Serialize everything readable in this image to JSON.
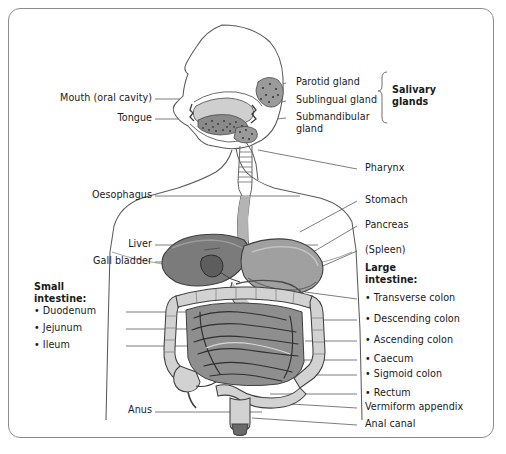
{
  "figure": {
    "border_color": "#8c8c8c",
    "background": "#ffffff",
    "text_color": "#1a1a1a",
    "leader_line_color": "#6e6e6e"
  },
  "palette": {
    "outline": "#4a4a4a",
    "liver": "#7b7b7b",
    "stomach": "#a0a0a0",
    "gall_bladder": "#5d5d5d",
    "small_intestine": "#8e8e8e",
    "large_intestine": "#d2d2d2",
    "mouth_cavity": "#cfcfcf",
    "tongue": "#8a8a8a",
    "gland": "#9a9a9a",
    "body_fill": "#ffffff"
  },
  "labels_left": [
    {
      "name": "mouth",
      "text": "Mouth (oral cavity)",
      "x": 44,
      "y": 97,
      "right": 152,
      "line_to_x": 250,
      "line_to_y": 102
    },
    {
      "name": "tongue",
      "text": "Tongue",
      "x": 44,
      "y": 117,
      "right": 152,
      "line_to_x": 250,
      "line_to_y": 115
    },
    {
      "name": "oesophagus",
      "text": "Oesophagus",
      "x": 44,
      "y": 194,
      "right": 152,
      "line_to_x": 250,
      "line_to_y": 196
    },
    {
      "name": "liver",
      "text": "Liver",
      "x": 44,
      "y": 243,
      "right": 152,
      "line_to_x": 250,
      "line_to_y": 245
    },
    {
      "name": "gall-bladder",
      "text": "Gall bladder",
      "x": 44,
      "y": 260,
      "right": 152,
      "line_to_x": 250,
      "line_to_y": 262
    },
    {
      "name": "anus",
      "text": "Anus",
      "x": 44,
      "y": 409,
      "right": 152,
      "line_to_x": 250,
      "line_to_y": 412
    }
  ],
  "small_intestine_group": {
    "heading_line1": "Small",
    "heading_line2": "intestine:",
    "items": [
      {
        "name": "duodenum",
        "text": "Duodenum",
        "y": 310
      },
      {
        "name": "jejunum",
        "text": "Jejunum",
        "y": 327
      },
      {
        "name": "ileum",
        "text": "Ileum",
        "y": 344
      }
    ]
  },
  "labels_right": [
    {
      "name": "parotid-gland",
      "text": "Parotid gland",
      "x": 296,
      "y": 81
    },
    {
      "name": "sublingual-gland",
      "text": "Sublingual gland",
      "x": 296,
      "y": 99
    },
    {
      "name": "submandibular-gland",
      "text": "Submandibular",
      "text2": "gland",
      "x": 296,
      "y": 116
    },
    {
      "name": "pharynx",
      "text": "Pharynx",
      "x": 365,
      "y": 167
    },
    {
      "name": "stomach",
      "text": "Stomach",
      "x": 365,
      "y": 199
    },
    {
      "name": "pancreas",
      "text": "Pancreas",
      "x": 365,
      "y": 224
    },
    {
      "name": "spleen",
      "text": "(Spleen)",
      "x": 365,
      "y": 249
    }
  ],
  "salivary_bracket": {
    "label_line1": "Salivary",
    "label_line2": "glands",
    "x": 395,
    "y": 89
  },
  "large_intestine_group": {
    "heading_line1": "Large",
    "heading_line2": "intestine:",
    "heading_x": 365,
    "heading_y": 267,
    "items": [
      {
        "name": "transverse-colon",
        "text": "Transverse colon",
        "y": 297,
        "bullet": true
      },
      {
        "name": "descending-colon",
        "text": "Descending colon",
        "y": 318,
        "bullet": true
      },
      {
        "name": "ascending-colon",
        "text": "Ascending colon",
        "y": 339,
        "bullet": true
      },
      {
        "name": "caecum",
        "text": "Caecum",
        "y": 358,
        "bullet": true
      },
      {
        "name": "sigmoid-colon",
        "text": "Sigmoid colon",
        "y": 373,
        "bullet": true
      },
      {
        "name": "rectum",
        "text": "Rectum",
        "y": 392,
        "bullet": true
      },
      {
        "name": "vermiform-appendix",
        "text": "Vermiform appendix",
        "y": 406,
        "bullet": false
      },
      {
        "name": "anal-canal",
        "text": "Anal canal",
        "y": 423,
        "bullet": false
      }
    ]
  }
}
